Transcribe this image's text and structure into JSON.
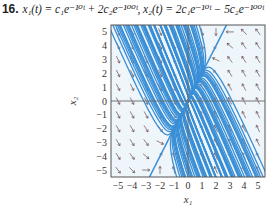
{
  "problem": {
    "number": "16.",
    "equation": "x₁(t) = c₁e⁻¹⁰ᵗ + 2c₂e⁻¹⁰⁰ᵗ, x₂(t) = 2c₁e⁻¹⁰ᵗ − 5c₂e⁻¹⁰⁰ᵗ"
  },
  "chart_data": {
    "type": "phase_portrait",
    "xlabel": "x1",
    "ylabel": "x2",
    "xlim": [
      -5.5,
      5.5
    ],
    "ylim": [
      -5.5,
      5.5
    ],
    "xticks": [
      "-5",
      "-4",
      "-3",
      "-2",
      "-1",
      "0",
      "1",
      "2",
      "3",
      "4",
      "5"
    ],
    "yticks": [
      "5",
      "4",
      "3",
      "2",
      "1",
      "0",
      "-1",
      "-2",
      "-3",
      "-4",
      "-5"
    ],
    "eigenvalues": [
      -10,
      -100
    ],
    "eigenvectors": [
      [
        1,
        2
      ],
      [
        2,
        -5
      ]
    ],
    "line_color": "#3a8fd6",
    "arrow_color": "#6a4a4a",
    "grid": false,
    "axes_lines_through_origin": true
  }
}
